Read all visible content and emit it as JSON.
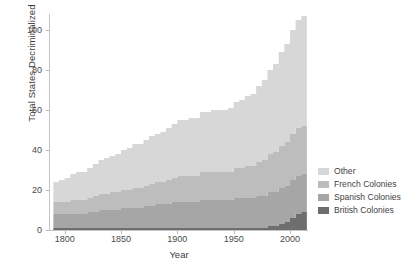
{
  "chart_data": {
    "type": "area",
    "stacked": true,
    "title": "",
    "xlabel": "Year",
    "ylabel": "Total States Decriminalized",
    "xlim": [
      1787,
      2016
    ],
    "ylim": [
      0,
      108
    ],
    "xticks": [
      1800,
      1850,
      1900,
      1950,
      2000
    ],
    "yticks": [
      0,
      20,
      40,
      60,
      80,
      100
    ],
    "grid": false,
    "legend_position": "right",
    "legend_order": [
      "Other",
      "French Colonies",
      "Spanish Colonies",
      "British Colonies"
    ],
    "colors": {
      "Other": "#d7d7d7",
      "French Colonies": "#bdbdbd",
      "Spanish Colonies": "#a6a6a6",
      "British Colonies": "#6e6e6e"
    },
    "x": [
      1790,
      1795,
      1800,
      1805,
      1810,
      1815,
      1820,
      1825,
      1830,
      1835,
      1840,
      1845,
      1850,
      1855,
      1860,
      1865,
      1870,
      1875,
      1880,
      1885,
      1890,
      1895,
      1900,
      1905,
      1910,
      1915,
      1920,
      1925,
      1930,
      1935,
      1940,
      1945,
      1950,
      1955,
      1960,
      1965,
      1970,
      1975,
      1980,
      1985,
      1990,
      1995,
      2000,
      2005,
      2010,
      2015
    ],
    "series": [
      {
        "name": "British Colonies",
        "stack_order": 1,
        "values": [
          1,
          1,
          1,
          1,
          1,
          1,
          1,
          1,
          1,
          1,
          1,
          1,
          1,
          1,
          1,
          1,
          1,
          1,
          1,
          1,
          1,
          1,
          1,
          1,
          1,
          1,
          1,
          1,
          1,
          1,
          1,
          1,
          1,
          1,
          1,
          1,
          1,
          1,
          2,
          2,
          3,
          4,
          6,
          8,
          9,
          9
        ]
      },
      {
        "name": "Spanish Colonies",
        "stack_order": 2,
        "values": [
          7,
          7,
          7,
          7,
          7,
          7,
          8,
          8,
          9,
          9,
          9,
          9,
          10,
          10,
          10,
          10,
          11,
          11,
          12,
          12,
          12,
          13,
          13,
          13,
          13,
          13,
          14,
          14,
          14,
          14,
          14,
          14,
          15,
          15,
          15,
          15,
          16,
          16,
          17,
          17,
          18,
          18,
          19,
          19,
          19,
          19
        ]
      },
      {
        "name": "French Colonies",
        "stack_order": 3,
        "values": [
          6,
          6,
          6,
          7,
          7,
          7,
          7,
          8,
          8,
          8,
          9,
          9,
          9,
          9,
          10,
          10,
          10,
          11,
          11,
          11,
          12,
          12,
          13,
          13,
          13,
          13,
          14,
          14,
          14,
          14,
          14,
          14,
          15,
          15,
          16,
          16,
          17,
          18,
          19,
          20,
          21,
          22,
          23,
          24,
          24,
          24
        ]
      },
      {
        "name": "Other",
        "stack_order": 4,
        "values": [
          10,
          11,
          12,
          13,
          14,
          14,
          15,
          16,
          17,
          18,
          18,
          19,
          20,
          21,
          22,
          22,
          23,
          24,
          24,
          25,
          26,
          27,
          28,
          28,
          29,
          29,
          30,
          30,
          31,
          31,
          31,
          32,
          33,
          34,
          35,
          36,
          38,
          40,
          42,
          44,
          47,
          49,
          52,
          54,
          55,
          55
        ]
      }
    ],
    "totals": [
      24,
      25,
      26,
      28,
      29,
      29,
      31,
      33,
      35,
      36,
      37,
      38,
      40,
      41,
      43,
      43,
      45,
      47,
      48,
      49,
      51,
      53,
      55,
      55,
      56,
      56,
      59,
      59,
      60,
      60,
      60,
      61,
      64,
      65,
      67,
      68,
      72,
      75,
      80,
      83,
      89,
      93,
      100,
      105,
      107,
      107
    ]
  },
  "axes": {
    "ylabel": "Total States Decriminalized",
    "xlabel": "Year",
    "yticks": [
      "0",
      "20",
      "40",
      "60",
      "80",
      "100"
    ],
    "xticks": [
      "1800",
      "1850",
      "1900",
      "1950",
      "2000"
    ]
  },
  "legend": {
    "items": [
      {
        "label": "Other",
        "color": "#d7d7d7"
      },
      {
        "label": "French Colonies",
        "color": "#bdbdbd"
      },
      {
        "label": "Spanish Colonies",
        "color": "#a6a6a6"
      },
      {
        "label": "British Colonies",
        "color": "#6e6e6e"
      }
    ]
  }
}
